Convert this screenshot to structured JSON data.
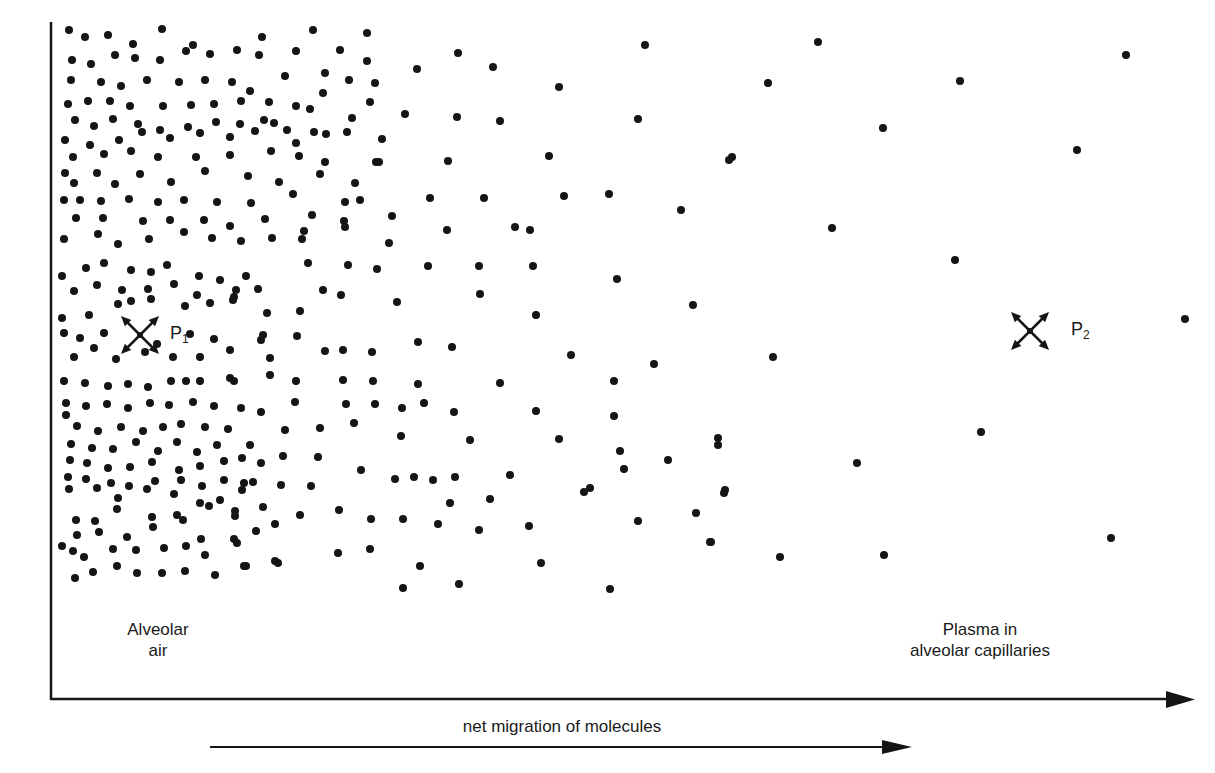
{
  "diagram": {
    "colors": {
      "ink": "#151515",
      "background": "#ffffff"
    },
    "axes": {
      "origin": [
        51,
        699
      ],
      "y_top": 22,
      "x_end": 1195
    },
    "labels": {
      "left_region_line1": "Alveolar",
      "left_region_line2": "air",
      "right_region_line1": "Plasma in",
      "right_region_line2": "alveolar capillaries",
      "migration_label": "net migration of molecules",
      "p1_main": "P",
      "p1_sub": "1",
      "p2_main": "P",
      "p2_sub": "2"
    },
    "pressure_markers": [
      {
        "id": "p1",
        "icon": "pressure-arrows-icon",
        "cx": 140,
        "cy": 335
      },
      {
        "id": "p2",
        "icon": "pressure-arrows-icon",
        "cx": 1030,
        "cy": 331
      }
    ],
    "migration_arrow": {
      "x1": 210,
      "x2": 912,
      "y": 747
    },
    "dot_radius": 4,
    "molecules": [
      [
        69,
        30
      ],
      [
        85,
        37
      ],
      [
        108,
        35
      ],
      [
        133,
        44
      ],
      [
        162,
        29
      ],
      [
        193,
        45
      ],
      [
        262,
        37
      ],
      [
        313,
        30
      ],
      [
        367,
        33
      ],
      [
        72,
        60
      ],
      [
        91,
        64
      ],
      [
        115,
        55
      ],
      [
        135,
        58
      ],
      [
        160,
        60
      ],
      [
        186,
        51
      ],
      [
        210,
        54
      ],
      [
        237,
        50
      ],
      [
        259,
        55
      ],
      [
        296,
        51
      ],
      [
        340,
        50
      ],
      [
        367,
        61
      ],
      [
        71,
        80
      ],
      [
        101,
        82
      ],
      [
        121,
        86
      ],
      [
        147,
        80
      ],
      [
        179,
        82
      ],
      [
        205,
        80
      ],
      [
        232,
        82
      ],
      [
        250,
        91
      ],
      [
        285,
        76
      ],
      [
        325,
        73
      ],
      [
        349,
        80
      ],
      [
        375,
        83
      ],
      [
        68,
        104
      ],
      [
        88,
        101
      ],
      [
        110,
        101
      ],
      [
        130,
        106
      ],
      [
        163,
        106
      ],
      [
        191,
        105
      ],
      [
        214,
        104
      ],
      [
        241,
        101
      ],
      [
        269,
        102
      ],
      [
        296,
        106
      ],
      [
        323,
        93
      ],
      [
        370,
        102
      ],
      [
        75,
        120
      ],
      [
        94,
        126
      ],
      [
        113,
        119
      ],
      [
        138,
        124
      ],
      [
        160,
        130
      ],
      [
        188,
        127
      ],
      [
        216,
        122
      ],
      [
        240,
        124
      ],
      [
        264,
        120
      ],
      [
        310,
        109
      ],
      [
        352,
        118
      ],
      [
        65,
        140
      ],
      [
        90,
        145
      ],
      [
        119,
        140
      ],
      [
        142,
        132
      ],
      [
        170,
        138
      ],
      [
        200,
        133
      ],
      [
        230,
        137
      ],
      [
        255,
        131
      ],
      [
        287,
        130
      ],
      [
        314,
        132
      ],
      [
        347,
        132
      ],
      [
        73,
        157
      ],
      [
        104,
        154
      ],
      [
        131,
        151
      ],
      [
        158,
        157
      ],
      [
        196,
        157
      ],
      [
        230,
        155
      ],
      [
        271,
        151
      ],
      [
        299,
        156
      ],
      [
        325,
        162
      ],
      [
        376,
        162
      ],
      [
        65,
        173
      ],
      [
        74,
        183
      ],
      [
        97,
        173
      ],
      [
        115,
        184
      ],
      [
        140,
        174
      ],
      [
        171,
        182
      ],
      [
        205,
        171
      ],
      [
        248,
        176
      ],
      [
        279,
        182
      ],
      [
        320,
        174
      ],
      [
        355,
        183
      ],
      [
        64,
        200
      ],
      [
        80,
        200
      ],
      [
        101,
        201
      ],
      [
        129,
        199
      ],
      [
        158,
        202
      ],
      [
        184,
        200
      ],
      [
        217,
        202
      ],
      [
        251,
        203
      ],
      [
        293,
        194
      ],
      [
        345,
        202
      ],
      [
        76,
        218
      ],
      [
        103,
        218
      ],
      [
        143,
        221
      ],
      [
        170,
        220
      ],
      [
        204,
        220
      ],
      [
        230,
        226
      ],
      [
        265,
        219
      ],
      [
        312,
        215
      ],
      [
        344,
        221
      ],
      [
        64,
        239
      ],
      [
        98,
        234
      ],
      [
        118,
        244
      ],
      [
        149,
        239
      ],
      [
        184,
        232
      ],
      [
        212,
        238
      ],
      [
        241,
        241
      ],
      [
        272,
        238
      ],
      [
        304,
        231
      ],
      [
        62,
        276
      ],
      [
        86,
        268
      ],
      [
        104,
        263
      ],
      [
        131,
        270
      ],
      [
        151,
        272
      ],
      [
        167,
        265
      ],
      [
        199,
        276
      ],
      [
        220,
        280
      ],
      [
        246,
        276
      ],
      [
        74,
        291
      ],
      [
        97,
        285
      ],
      [
        122,
        290
      ],
      [
        148,
        289
      ],
      [
        174,
        284
      ],
      [
        197,
        295
      ],
      [
        234,
        297
      ],
      [
        258,
        289
      ],
      [
        62,
        318
      ],
      [
        89,
        315
      ],
      [
        118,
        304
      ],
      [
        131,
        301
      ],
      [
        151,
        299
      ],
      [
        185,
        306
      ],
      [
        210,
        303
      ],
      [
        236,
        290
      ],
      [
        64,
        333
      ],
      [
        80,
        338
      ],
      [
        104,
        333
      ],
      [
        157,
        344
      ],
      [
        190,
        334
      ],
      [
        214,
        339
      ],
      [
        261,
        340
      ],
      [
        74,
        357
      ],
      [
        94,
        348
      ],
      [
        116,
        359
      ],
      [
        145,
        352
      ],
      [
        173,
        357
      ],
      [
        200,
        357
      ],
      [
        230,
        350
      ],
      [
        270,
        358
      ],
      [
        64,
        381
      ],
      [
        85,
        383
      ],
      [
        108,
        386
      ],
      [
        128,
        384
      ],
      [
        148,
        387
      ],
      [
        171,
        381
      ],
      [
        186,
        381
      ],
      [
        200,
        381
      ],
      [
        230,
        378
      ],
      [
        66,
        403
      ],
      [
        86,
        406
      ],
      [
        107,
        404
      ],
      [
        128,
        408
      ],
      [
        150,
        403
      ],
      [
        169,
        405
      ],
      [
        193,
        402
      ],
      [
        214,
        406
      ],
      [
        241,
        408
      ],
      [
        66,
        415
      ],
      [
        77,
        426
      ],
      [
        98,
        431
      ],
      [
        121,
        427
      ],
      [
        143,
        431
      ],
      [
        163,
        427
      ],
      [
        181,
        424
      ],
      [
        205,
        427
      ],
      [
        228,
        429
      ],
      [
        71,
        444
      ],
      [
        92,
        448
      ],
      [
        113,
        449
      ],
      [
        136,
        442
      ],
      [
        158,
        451
      ],
      [
        177,
        442
      ],
      [
        197,
        452
      ],
      [
        217,
        445
      ],
      [
        250,
        445
      ],
      [
        70,
        460
      ],
      [
        87,
        463
      ],
      [
        108,
        468
      ],
      [
        130,
        467
      ],
      [
        152,
        462
      ],
      [
        179,
        470
      ],
      [
        200,
        466
      ],
      [
        224,
        461
      ],
      [
        261,
        463
      ],
      [
        68,
        477
      ],
      [
        86,
        479
      ],
      [
        111,
        483
      ],
      [
        129,
        486
      ],
      [
        155,
        481
      ],
      [
        181,
        480
      ],
      [
        202,
        486
      ],
      [
        224,
        480
      ],
      [
        253,
        482
      ],
      [
        69,
        489
      ],
      [
        97,
        488
      ],
      [
        118,
        498
      ],
      [
        147,
        489
      ],
      [
        174,
        494
      ],
      [
        200,
        503
      ],
      [
        220,
        500
      ],
      [
        242,
        490
      ],
      [
        76,
        520
      ],
      [
        95,
        521
      ],
      [
        117,
        509
      ],
      [
        152,
        517
      ],
      [
        177,
        515
      ],
      [
        209,
        506
      ],
      [
        235,
        511
      ],
      [
        263,
        507
      ],
      [
        77,
        535
      ],
      [
        99,
        532
      ],
      [
        127,
        537
      ],
      [
        153,
        527
      ],
      [
        183,
        520
      ],
      [
        201,
        539
      ],
      [
        234,
        539
      ],
      [
        256,
        531
      ],
      [
        62,
        546
      ],
      [
        73,
        551
      ],
      [
        84,
        557
      ],
      [
        113,
        549
      ],
      [
        136,
        550
      ],
      [
        164,
        548
      ],
      [
        186,
        546
      ],
      [
        205,
        555
      ],
      [
        237,
        543
      ],
      [
        75,
        578
      ],
      [
        93,
        572
      ],
      [
        117,
        566
      ],
      [
        137,
        573
      ],
      [
        162,
        573
      ],
      [
        185,
        571
      ],
      [
        215,
        575
      ],
      [
        244,
        566
      ],
      [
        278,
        563
      ],
      [
        274,
        123
      ],
      [
        296,
        143
      ],
      [
        326,
        134
      ],
      [
        382,
        139
      ],
      [
        417,
        69
      ],
      [
        458,
        53
      ],
      [
        493,
        67
      ],
      [
        559,
        87
      ],
      [
        645,
        45
      ],
      [
        405,
        114
      ],
      [
        457,
        117
      ],
      [
        500,
        121
      ],
      [
        638,
        119
      ],
      [
        379,
        162
      ],
      [
        448,
        161
      ],
      [
        549,
        156
      ],
      [
        729,
        160
      ],
      [
        360,
        200
      ],
      [
        392,
        216
      ],
      [
        430,
        198
      ],
      [
        484,
        198
      ],
      [
        564,
        196
      ],
      [
        609,
        194
      ],
      [
        681,
        210
      ],
      [
        302,
        239
      ],
      [
        345,
        227
      ],
      [
        389,
        243
      ],
      [
        447,
        230
      ],
      [
        515,
        227
      ],
      [
        530,
        230
      ],
      [
        308,
        263
      ],
      [
        348,
        265
      ],
      [
        377,
        269
      ],
      [
        428,
        266
      ],
      [
        479,
        266
      ],
      [
        533,
        266
      ],
      [
        617,
        279
      ],
      [
        233,
        300
      ],
      [
        267,
        313
      ],
      [
        300,
        311
      ],
      [
        323,
        290
      ],
      [
        341,
        295
      ],
      [
        397,
        302
      ],
      [
        480,
        294
      ],
      [
        536,
        315
      ],
      [
        693,
        305
      ],
      [
        263,
        335
      ],
      [
        297,
        336
      ],
      [
        325,
        351
      ],
      [
        343,
        350
      ],
      [
        372,
        352
      ],
      [
        418,
        342
      ],
      [
        452,
        347
      ],
      [
        571,
        355
      ],
      [
        654,
        364
      ],
      [
        234,
        381
      ],
      [
        270,
        375
      ],
      [
        296,
        381
      ],
      [
        343,
        380
      ],
      [
        373,
        381
      ],
      [
        418,
        384
      ],
      [
        500,
        383
      ],
      [
        614,
        381
      ],
      [
        773,
        357
      ],
      [
        295,
        402
      ],
      [
        346,
        404
      ],
      [
        375,
        404
      ],
      [
        402,
        408
      ],
      [
        424,
        403
      ],
      [
        454,
        412
      ],
      [
        536,
        411
      ],
      [
        614,
        416
      ],
      [
        261,
        412
      ],
      [
        285,
        430
      ],
      [
        320,
        428
      ],
      [
        354,
        423
      ],
      [
        401,
        436
      ],
      [
        470,
        440
      ],
      [
        559,
        439
      ],
      [
        718,
        438
      ],
      [
        242,
        458
      ],
      [
        283,
        456
      ],
      [
        318,
        457
      ],
      [
        361,
        470
      ],
      [
        414,
        477
      ],
      [
        510,
        475
      ],
      [
        584,
        492
      ],
      [
        624,
        469
      ],
      [
        724,
        493
      ],
      [
        244,
        483
      ],
      [
        281,
        485
      ],
      [
        311,
        486
      ],
      [
        395,
        479
      ],
      [
        433,
        480
      ],
      [
        455,
        477
      ],
      [
        620,
        451
      ],
      [
        668,
        460
      ],
      [
        235,
        516
      ],
      [
        275,
        524
      ],
      [
        300,
        515
      ],
      [
        339,
        510
      ],
      [
        371,
        519
      ],
      [
        403,
        519
      ],
      [
        438,
        524
      ],
      [
        479,
        530
      ],
      [
        529,
        526
      ],
      [
        638,
        521
      ],
      [
        246,
        566
      ],
      [
        275,
        561
      ],
      [
        338,
        553
      ],
      [
        370,
        549
      ],
      [
        420,
        566
      ],
      [
        459,
        584
      ],
      [
        541,
        563
      ],
      [
        610,
        589
      ],
      [
        710,
        542
      ],
      [
        403,
        588
      ],
      [
        450,
        503
      ],
      [
        490,
        499
      ],
      [
        590,
        488
      ],
      [
        696,
        513
      ],
      [
        768,
        83
      ],
      [
        818,
        42
      ],
      [
        960,
        81
      ],
      [
        883,
        128
      ],
      [
        1077,
        150
      ],
      [
        1126,
        55
      ],
      [
        732,
        157
      ],
      [
        832,
        228
      ],
      [
        955,
        260
      ],
      [
        1185,
        319
      ],
      [
        981,
        432
      ],
      [
        857,
        463
      ],
      [
        1111,
        538
      ],
      [
        884,
        555
      ],
      [
        780,
        557
      ],
      [
        725,
        490
      ],
      [
        711,
        542
      ],
      [
        718,
        445
      ]
    ]
  }
}
